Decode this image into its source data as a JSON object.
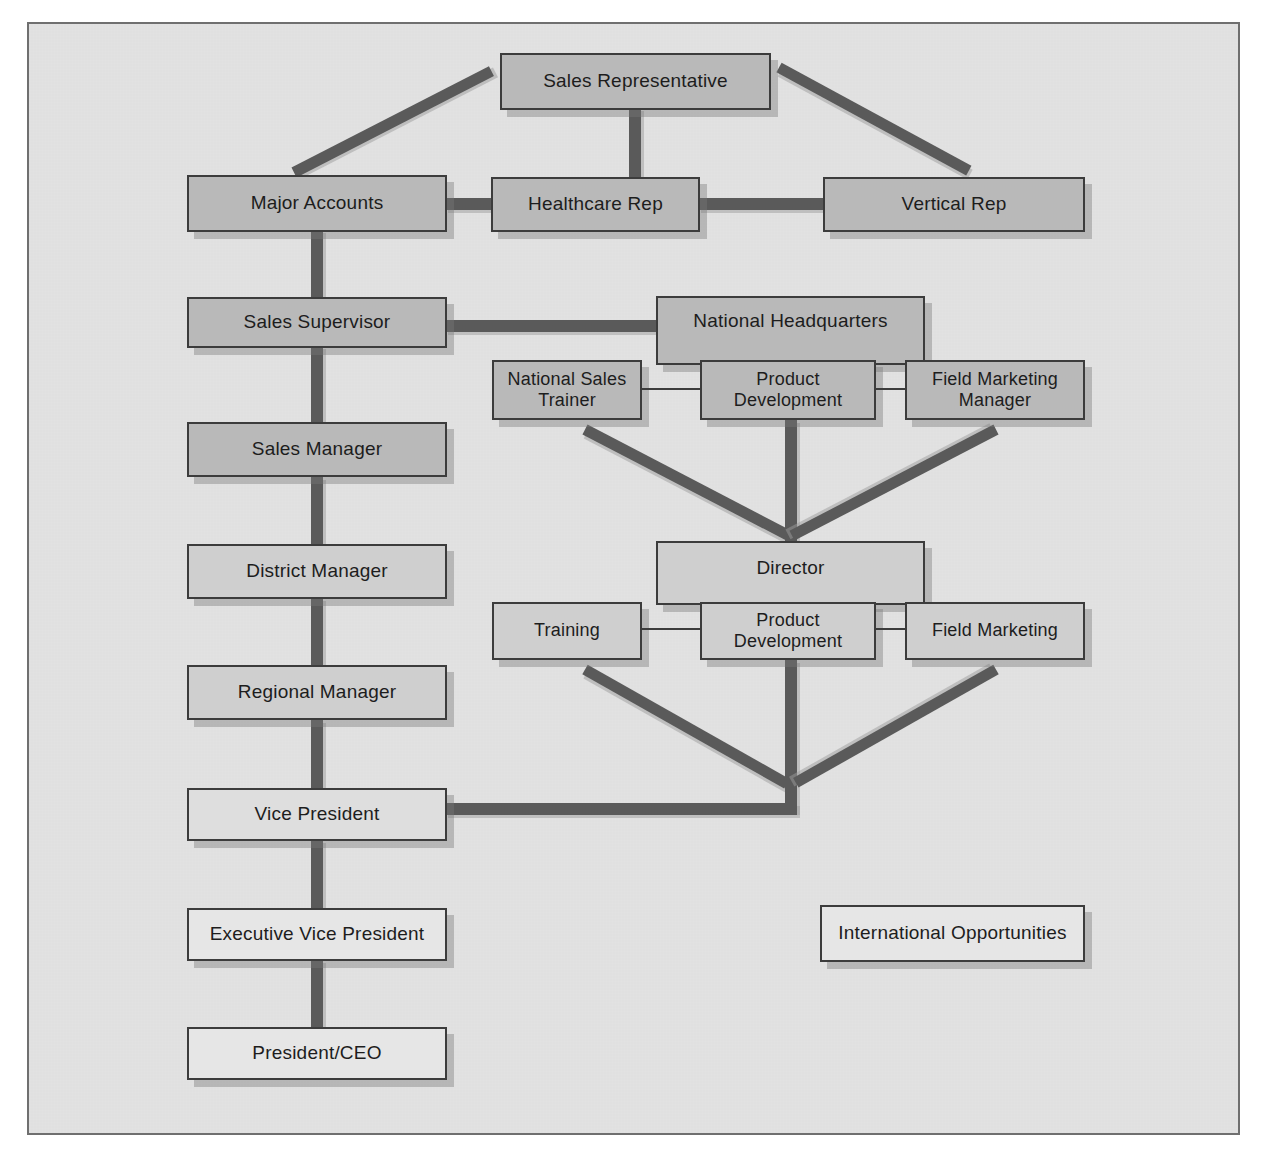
{
  "diagram": {
    "type": "org-chart",
    "colors": {
      "page_background": "#ffffff",
      "canvas_background": "#e2e2e2",
      "frame_border": "#6f6f6f",
      "node_border": "#3c3c3c",
      "connector": "#5a5a5a",
      "node_fill_dark": "#b9b9b9",
      "node_fill_mid": "#cfcfcf",
      "node_fill_light": "#dedede",
      "node_fill_pale": "#e6e6e6",
      "text": "#1d1d1d"
    },
    "nodes": [
      {
        "id": "sales-representative",
        "label": "Sales Representative"
      },
      {
        "id": "major-accounts",
        "label": "Major Accounts"
      },
      {
        "id": "healthcare-rep",
        "label": "Healthcare Rep"
      },
      {
        "id": "vertical-rep",
        "label": "Vertical Rep"
      },
      {
        "id": "sales-supervisor",
        "label": "Sales Supervisor"
      },
      {
        "id": "national-headquarters",
        "label": "National Headquarters"
      },
      {
        "id": "national-sales-trainer",
        "label": "National Sales Trainer"
      },
      {
        "id": "hq-product-development",
        "label": "Product Development"
      },
      {
        "id": "field-marketing-manager",
        "label": "Field Marketing Manager"
      },
      {
        "id": "sales-manager",
        "label": "Sales Manager"
      },
      {
        "id": "district-manager",
        "label": "District Manager"
      },
      {
        "id": "director",
        "label": "Director"
      },
      {
        "id": "training",
        "label": "Training"
      },
      {
        "id": "dir-product-development",
        "label": "Product Development"
      },
      {
        "id": "field-marketing",
        "label": "Field Marketing"
      },
      {
        "id": "regional-manager",
        "label": "Regional Manager"
      },
      {
        "id": "vice-president",
        "label": "Vice President"
      },
      {
        "id": "executive-vice-president",
        "label": "Executive Vice President"
      },
      {
        "id": "president-ceo",
        "label": "President/CEO"
      },
      {
        "id": "international-opportunities",
        "label": "International Opportunities"
      }
    ],
    "edges": [
      {
        "from": "sales-representative",
        "to": "major-accounts",
        "style": "diagonal"
      },
      {
        "from": "sales-representative",
        "to": "healthcare-rep",
        "style": "vertical"
      },
      {
        "from": "sales-representative",
        "to": "vertical-rep",
        "style": "diagonal"
      },
      {
        "from": "major-accounts",
        "to": "healthcare-rep",
        "style": "horizontal"
      },
      {
        "from": "healthcare-rep",
        "to": "vertical-rep",
        "style": "horizontal"
      },
      {
        "from": "major-accounts",
        "to": "sales-supervisor",
        "style": "vertical"
      },
      {
        "from": "sales-supervisor",
        "to": "national-headquarters",
        "style": "horizontal"
      },
      {
        "from": "national-sales-trainer",
        "to": "hq-product-development",
        "style": "horizontal-thin"
      },
      {
        "from": "hq-product-development",
        "to": "field-marketing-manager",
        "style": "horizontal-thin"
      },
      {
        "from": "national-sales-trainer",
        "to": "director",
        "style": "diagonal"
      },
      {
        "from": "hq-product-development",
        "to": "director",
        "style": "vertical"
      },
      {
        "from": "field-marketing-manager",
        "to": "director",
        "style": "diagonal"
      },
      {
        "from": "sales-supervisor",
        "to": "sales-manager",
        "style": "vertical"
      },
      {
        "from": "sales-manager",
        "to": "district-manager",
        "style": "vertical"
      },
      {
        "from": "district-manager",
        "to": "regional-manager",
        "style": "vertical"
      },
      {
        "from": "training",
        "to": "dir-product-development",
        "style": "horizontal-thin"
      },
      {
        "from": "dir-product-development",
        "to": "field-marketing",
        "style": "horizontal-thin"
      },
      {
        "from": "training",
        "to": "vice-president",
        "style": "diagonal"
      },
      {
        "from": "dir-product-development",
        "to": "vice-president",
        "style": "vertical"
      },
      {
        "from": "field-marketing",
        "to": "vice-president",
        "style": "diagonal"
      },
      {
        "from": "regional-manager",
        "to": "vice-president",
        "style": "vertical"
      },
      {
        "from": "vice-president",
        "to": "executive-vice-president",
        "style": "vertical"
      },
      {
        "from": "executive-vice-president",
        "to": "president-ceo",
        "style": "vertical"
      }
    ]
  }
}
